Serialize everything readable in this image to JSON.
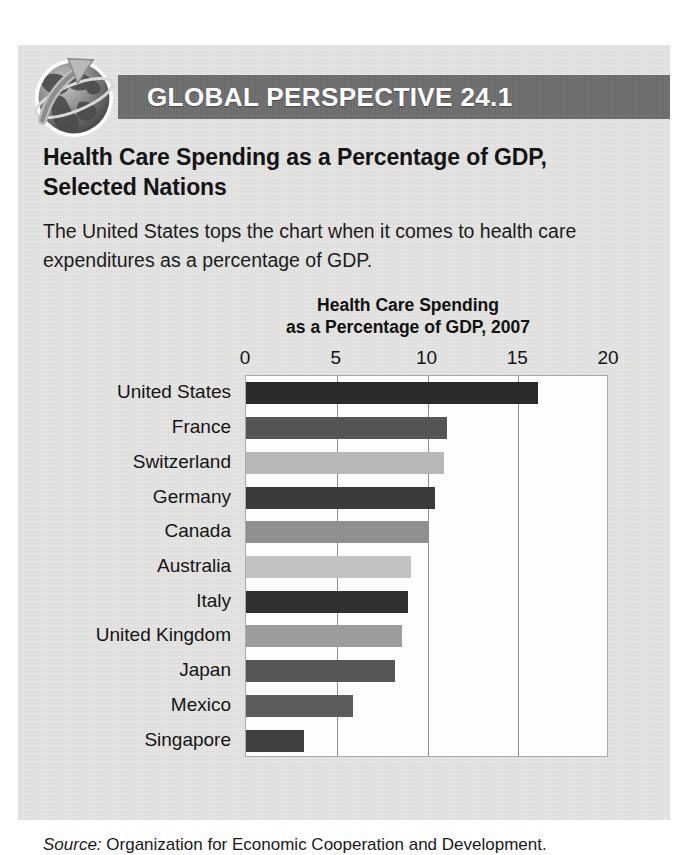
{
  "feature": {
    "header_label": "GLOBAL PERSPECTIVE 24.1",
    "globe_icon_name": "globe-with-arrow-icon",
    "heading_line1": "Health Care Spending as a Percentage of GDP,",
    "heading_line2": "Selected Nations",
    "body_text": "The United States tops the chart when it comes to health care expenditures as a percentage of GDP.",
    "source_label": "Source:",
    "source_text": " Organization for Economic Cooperation and Development."
  },
  "colors": {
    "header_band": "#6f6f6f",
    "box_background": "#e3e3e1",
    "plot_background": "#fdfdfd",
    "gridline": "#8e8e8e",
    "text": "#1b1b1b"
  },
  "chart_data": {
    "type": "bar",
    "orientation": "horizontal",
    "title": "Health Care Spending as a Percentage of GDP, 2007",
    "title_line1": "Health Care Spending",
    "title_line2": "as a Percentage of GDP, 2007",
    "xlabel": "",
    "ylabel": "",
    "xlim": [
      0,
      20
    ],
    "ticks": [
      "0",
      "5",
      "10",
      "15",
      "20"
    ],
    "tick_values": [
      0,
      5,
      10,
      15,
      20
    ],
    "grid": true,
    "legend": "none",
    "categories": [
      "United States",
      "France",
      "Switzerland",
      "Germany",
      "Canada",
      "Australia",
      "Italy",
      "United Kingdom",
      "Japan",
      "Mexico",
      "Singapore"
    ],
    "values": [
      16.1,
      11.1,
      10.9,
      10.4,
      10.0,
      9.1,
      8.9,
      8.6,
      8.2,
      5.9,
      3.2
    ],
    "bar_colors": [
      "#2b2b2b",
      "#555555",
      "#b8b8b8",
      "#3a3a3a",
      "#8f8f8f",
      "#c2c2c2",
      "#303030",
      "#9c9c9c",
      "#565656",
      "#5c5c5c",
      "#404040"
    ]
  }
}
